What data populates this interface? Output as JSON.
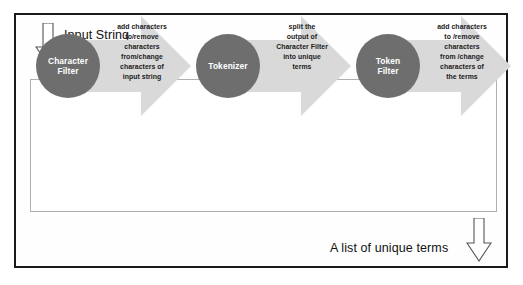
{
  "diagram": {
    "title": "Analyzer",
    "input_label": "Input String",
    "output_label": "A list of unique terms",
    "colors": {
      "circle_fill": "#6e6e6e",
      "arrow_fill": "#d9d9d9",
      "frame_border": "#1a1a1a",
      "inner_border": "#b0b0b0",
      "circle_text": "#ffffff",
      "body_text": "#1b1b1b"
    },
    "stages": [
      {
        "name": "Character Filter",
        "circle_lines": [
          "Character",
          "Filter"
        ],
        "description_lines": [
          "add characters",
          "to/remove",
          "characters",
          "from/change",
          "characters of",
          "input string"
        ]
      },
      {
        "name": "Tokenizer",
        "circle_lines": [
          "Tokenizer"
        ],
        "description_lines": [
          "split the",
          "output of",
          "Character Filter",
          "into unique",
          "terms"
        ]
      },
      {
        "name": "Token Filter",
        "circle_lines": [
          "Token",
          "Filter"
        ],
        "description_lines": [
          "add characters",
          "to /remove",
          "characters",
          "from /change",
          "characters of",
          "the terms"
        ]
      }
    ]
  }
}
